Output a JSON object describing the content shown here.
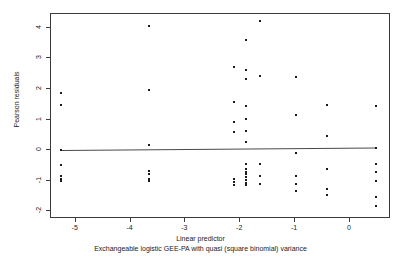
{
  "chart_data": {
    "type": "scatter",
    "title": "",
    "xlabel": "Linear predictor",
    "sublabel": "Exchangeable logistic GEE-PA with quasi (square binomial) variance",
    "ylabel": "Pearson residuals",
    "xlim": [
      -5.45,
      0.75
    ],
    "ylim": [
      -2.25,
      4.45
    ],
    "xticks": [
      -5,
      -4,
      -3,
      -2,
      -1,
      0
    ],
    "xticklabels": [
      "-5",
      "-4",
      "-3",
      "-2",
      "-1",
      "0"
    ],
    "yticks": [
      4,
      3,
      2,
      1,
      0,
      -1,
      -2
    ],
    "yticklabels": [
      "4",
      "3",
      "2",
      "1",
      "0",
      "-1",
      "-2"
    ],
    "grid": false,
    "legend": null,
    "marker": "filled-square",
    "marker_color": "#1a1a1a",
    "reference_line": {
      "type": "horizontal-trend",
      "y_left": -0.01,
      "y_right": 0.07,
      "x_left": -5.27,
      "x_right": 0.47,
      "color": "#4a4a4a"
    },
    "points": [
      [
        -5.27,
        1.87
      ],
      [
        -5.27,
        1.49
      ],
      [
        -5.27,
        -0.01
      ],
      [
        -5.27,
        -0.5
      ],
      [
        -5.27,
        -0.86
      ],
      [
        -5.27,
        -0.94
      ],
      [
        -5.27,
        -1.02
      ],
      [
        -3.66,
        4.06
      ],
      [
        -3.66,
        1.98
      ],
      [
        -3.66,
        0.18
      ],
      [
        -3.66,
        -0.68
      ],
      [
        -3.66,
        -0.77
      ],
      [
        -3.66,
        -0.94
      ],
      [
        -3.66,
        -1.02
      ],
      [
        -2.12,
        2.72
      ],
      [
        -2.12,
        1.58
      ],
      [
        -2.12,
        0.93
      ],
      [
        -2.12,
        0.6
      ],
      [
        -2.12,
        -0.93
      ],
      [
        -2.12,
        -1.03
      ],
      [
        -2.12,
        -1.13
      ],
      [
        -1.9,
        3.61
      ],
      [
        -1.9,
        2.62
      ],
      [
        -1.9,
        2.31
      ],
      [
        -1.9,
        1.43
      ],
      [
        -1.9,
        1.03
      ],
      [
        -1.9,
        0.61
      ],
      [
        -1.9,
        0.28
      ],
      [
        -1.9,
        -0.45
      ],
      [
        -1.9,
        -0.62
      ],
      [
        -1.9,
        -0.71
      ],
      [
        -1.9,
        -0.79
      ],
      [
        -1.9,
        -0.88
      ],
      [
        -1.9,
        -0.97
      ],
      [
        -1.9,
        -1.06
      ],
      [
        -1.9,
        -1.14
      ],
      [
        -1.63,
        4.21
      ],
      [
        -1.63,
        2.43
      ],
      [
        -1.63,
        -0.45
      ],
      [
        -1.63,
        -0.84
      ],
      [
        -1.63,
        -1.12
      ],
      [
        -0.99,
        2.4
      ],
      [
        -0.99,
        1.15
      ],
      [
        -0.99,
        -0.09
      ],
      [
        -0.99,
        -0.86
      ],
      [
        -0.99,
        -1.12
      ],
      [
        -0.99,
        -1.34
      ],
      [
        -0.41,
        1.48
      ],
      [
        -0.41,
        0.46
      ],
      [
        -0.41,
        -0.6
      ],
      [
        -0.41,
        -1.27
      ],
      [
        -0.41,
        -1.46
      ],
      [
        0.47,
        1.45
      ],
      [
        0.47,
        0.07
      ],
      [
        0.47,
        -0.46
      ],
      [
        0.47,
        -0.7
      ],
      [
        0.47,
        -1.01
      ],
      [
        0.47,
        -1.52
      ],
      [
        0.47,
        -1.84
      ]
    ]
  }
}
